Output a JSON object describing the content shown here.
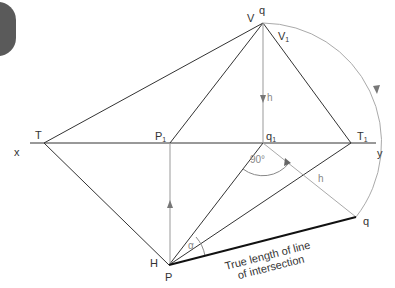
{
  "diagram": {
    "labels": {
      "V": "V",
      "q_top": "q",
      "V1": "V",
      "V1_sub": "1",
      "h_vertical": "h",
      "T": "T",
      "x": "x",
      "P1": "P",
      "P1_sub": "1",
      "q1": "q",
      "q1_sub": "1",
      "T1": "T",
      "T1_sub": "1",
      "y": "y",
      "angle_90": "90°",
      "h_diagonal": "h",
      "q_bottom": "q",
      "H": "H",
      "P": "P",
      "alpha": "α",
      "true_length_line1": "True length of line",
      "true_length_line2": "of intersection"
    },
    "points": {
      "q_top": [
        263,
        23
      ],
      "T": [
        44,
        143
      ],
      "P1": [
        170,
        143
      ],
      "q1": [
        263,
        143
      ],
      "T1": [
        351,
        143
      ],
      "P": [
        169,
        265
      ],
      "q_bottom": [
        356,
        217
      ]
    },
    "colors": {
      "line_dark": "#333333",
      "line_grey": "#aaaaaa",
      "true_length": "#111111",
      "tab": "#5a5a5a"
    }
  }
}
